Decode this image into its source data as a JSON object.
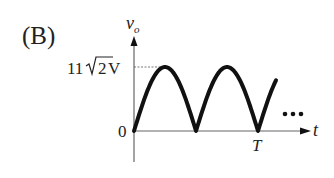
{
  "label": "(B)",
  "chart_data": {
    "type": "line",
    "title": "(B)",
    "xlabel": "t",
    "ylabel": "v_o",
    "ylabel_main": "v",
    "ylabel_sub": "o",
    "y_ticks": [
      {
        "label": "0",
        "value": 0
      },
      {
        "label_prefix": "11",
        "label_radicand": "2",
        "label_suffix": "V",
        "value": 15.556
      }
    ],
    "x_ticks": [
      {
        "label": "T",
        "value": 2
      }
    ],
    "waveform": "full-wave rectified sine |11√2 sin(πt/ (T/2))|",
    "peak": 15.556,
    "x": [
      0,
      0.5,
      1,
      1.5,
      2,
      2.3
    ],
    "y": [
      0,
      15.556,
      0,
      15.556,
      0,
      9.1
    ],
    "continuation": "...",
    "grid": false,
    "peak_reference_line": "dashed"
  }
}
